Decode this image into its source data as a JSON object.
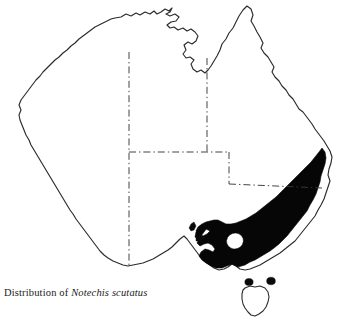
{
  "figure": {
    "caption_prefix": "Distribution of",
    "species_name": "Notechis scutatus",
    "width_px": 338,
    "height_px": 329
  },
  "map": {
    "region_label": "Australia",
    "background_color": "#ffffff",
    "coastline_color": "#2b2b2b",
    "range_fill_color": "#060606",
    "state_border_color": "#3a3a3a",
    "state_border_style": "dash-dot",
    "landmasses": [
      {
        "name": "mainland-australia",
        "filled": false
      },
      {
        "name": "tasmania",
        "filled": false
      },
      {
        "name": "king-island",
        "filled": true
      },
      {
        "name": "flinders-island",
        "filled": true
      },
      {
        "name": "kangaroo-island",
        "filled": true
      }
    ],
    "distribution": {
      "label": "shaded distribution range",
      "description": "southeastern Australia, coastal New South Wales, Victoria, southeastern South Australia and Bass Strait islands",
      "unshaded_inset_label": "unshaded gap in western Victoria"
    },
    "state_borders": [
      {
        "name": "wa-nt-sa-border",
        "orientation": "vertical"
      },
      {
        "name": "nt-qld-border",
        "orientation": "vertical"
      },
      {
        "name": "nt-sa-border",
        "orientation": "horizontal"
      },
      {
        "name": "sa-qld-nsw-border",
        "orientation": "vertical"
      },
      {
        "name": "qld-nsw-border",
        "orientation": "horizontal"
      }
    ]
  }
}
